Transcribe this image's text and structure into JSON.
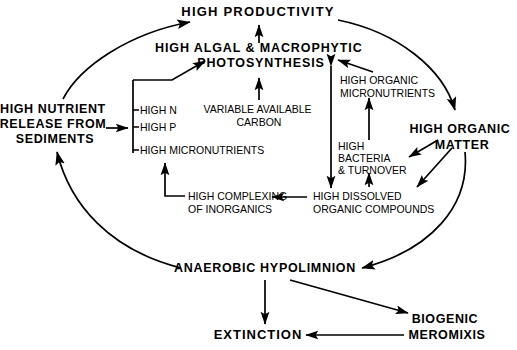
{
  "diagram": {
    "stroke_color": "#000000",
    "background_color": "#ffffff",
    "nodes": [
      {
        "id": "high-productivity",
        "label": "HIGH PRODUCTIVITY",
        "lines": [
          "HIGH PRODUCTIVITY"
        ],
        "weight": "bold",
        "size": 13,
        "x": 258,
        "y": 16,
        "anchor": "middle"
      },
      {
        "id": "high-algal-photosynthesis",
        "label": "HIGH ALGAL & MACROPHYTIC PHOTOSYNTHESIS",
        "lines": [
          "HIGH ALGAL & MACROPHYTIC",
          "PHOTOSYNTHESIS"
        ],
        "weight": "bold",
        "size": 12.5,
        "x": 261,
        "y": 52,
        "anchor": "middle"
      },
      {
        "id": "high-nutrient-release",
        "label": "HIGH NUTRIENT RELEASE FROM SEDIMENTS",
        "lines": [
          "HIGH NUTRIENT",
          "RELEASE FROM",
          "SEDIMENTS"
        ],
        "weight": "bold",
        "size": 12.5,
        "x": 55,
        "y": 113,
        "anchor": "middle"
      },
      {
        "id": "high-n",
        "label": "HIGH N",
        "lines": [
          "HIGH N"
        ],
        "weight": "normal",
        "size": 10.5,
        "x": 139,
        "y": 113,
        "anchor": "start"
      },
      {
        "id": "high-p",
        "label": "HIGH P",
        "lines": [
          "HIGH P"
        ],
        "weight": "normal",
        "size": 10.5,
        "x": 139,
        "y": 130,
        "anchor": "start"
      },
      {
        "id": "high-micronutrients",
        "label": "HIGH MICRONUTRIENTS",
        "lines": [
          "HIGH MICRONUTRIENTS"
        ],
        "weight": "normal",
        "size": 10.5,
        "x": 139,
        "y": 150,
        "anchor": "start"
      },
      {
        "id": "variable-available-carbon",
        "label": "VARIABLE AVAILABLE CARBON",
        "lines": [
          "VARIABLE AVAILABLE",
          "CARBON"
        ],
        "weight": "normal",
        "size": 10.5,
        "x": 259,
        "y": 113,
        "anchor": "middle"
      },
      {
        "id": "high-organic-micronutrients",
        "label": "HIGH ORGANIC MICRONUTRIENTS",
        "lines": [
          "HIGH ORGANIC",
          "MICRONUTRIENTS"
        ],
        "weight": "normal",
        "size": 10.5,
        "x": 340,
        "y": 84,
        "anchor": "start"
      },
      {
        "id": "high-organic-matter",
        "label": "HIGH ORGANIC MATTER",
        "lines": [
          "HIGH ORGANIC",
          "MATTER"
        ],
        "weight": "bold",
        "size": 12.5,
        "x": 462,
        "y": 133,
        "anchor": "middle"
      },
      {
        "id": "high-bacteria-turnover",
        "label": "HIGH BACTERIA & TURNOVER",
        "lines": [
          "HIGH",
          "BACTERIA",
          "& TURNOVER"
        ],
        "weight": "normal",
        "size": 10.5,
        "x": 338,
        "y": 150,
        "anchor": "start"
      },
      {
        "id": "high-complexing-inorganics",
        "label": "HIGH COMPLEXING OF INORGANICS",
        "lines": [
          "HIGH COMPLEXING",
          "OF INORGANICS"
        ],
        "weight": "normal",
        "size": 10.5,
        "x": 188,
        "y": 200,
        "anchor": "start"
      },
      {
        "id": "high-dissolved-organic",
        "label": "HIGH DISSOLVED ORGANIC COMPOUNDS",
        "lines": [
          "HIGH DISSOLVED",
          "ORGANIC COMPOUNDS"
        ],
        "weight": "normal",
        "size": 10.5,
        "x": 313,
        "y": 200,
        "anchor": "start"
      },
      {
        "id": "anaerobic-hypolimnion",
        "label": "ANAEROBIC HYPOLIMNION",
        "lines": [
          "ANAEROBIC HYPOLIMNION"
        ],
        "weight": "bold",
        "size": 12.5,
        "x": 265,
        "y": 272,
        "anchor": "middle"
      },
      {
        "id": "biogenic-meromixis",
        "label": "BIOGENIC MEROMIXIS",
        "lines": [
          "BIOGENIC",
          "MEROMIXIS"
        ],
        "weight": "bold",
        "size": 12.5,
        "x": 447,
        "y": 323,
        "anchor": "middle"
      },
      {
        "id": "extinction",
        "label": "EXTINCTION",
        "lines": [
          "EXTINCTION"
        ],
        "weight": "bold",
        "size": 13,
        "x": 258,
        "y": 339,
        "anchor": "middle"
      }
    ],
    "edges": [
      {
        "id": "edge-sediments-to-productivity",
        "from": "high-nutrient-release",
        "to": "high-productivity",
        "style": "curved-arc"
      },
      {
        "id": "edge-productivity-to-organic-matter",
        "from": "high-productivity",
        "to": "high-organic-matter",
        "style": "curved-arc"
      },
      {
        "id": "edge-organic-matter-to-hypolimnion",
        "from": "high-organic-matter",
        "to": "anaerobic-hypolimnion",
        "style": "curved-arc"
      },
      {
        "id": "edge-hypolimnion-to-sediments",
        "from": "anaerobic-hypolimnion",
        "to": "high-nutrient-release",
        "style": "curved-arc"
      },
      {
        "id": "edge-photosynthesis-to-productivity",
        "from": "high-algal-photosynthesis",
        "to": "high-productivity",
        "style": "straight"
      },
      {
        "id": "edge-carbon-to-photosynthesis",
        "from": "variable-available-carbon",
        "to": "high-algal-photosynthesis",
        "style": "straight"
      },
      {
        "id": "edge-sediments-to-nutrient-list",
        "from": "high-nutrient-release",
        "to": "high-n",
        "style": "straight"
      },
      {
        "id": "edge-nutrient-list-to-photosynthesis",
        "from": "high-n",
        "to": "high-algal-photosynthesis",
        "style": "elbow"
      },
      {
        "id": "edge-complexing-to-micronutrients",
        "from": "high-complexing-inorganics",
        "to": "high-micronutrients",
        "style": "elbow"
      },
      {
        "id": "edge-dissolved-to-complexing",
        "from": "high-dissolved-organic",
        "to": "high-complexing-inorganics",
        "style": "straight"
      },
      {
        "id": "edge-organic-micronutrients-to-photo",
        "from": "high-organic-micronutrients",
        "to": "high-algal-photosynthesis",
        "style": "straight"
      },
      {
        "id": "edge-bacteria-to-organic-micronutrients",
        "from": "high-bacteria-turnover",
        "to": "high-organic-micronutrients",
        "style": "straight"
      },
      {
        "id": "edge-dissolved-to-bacteria",
        "from": "high-dissolved-organic",
        "to": "high-bacteria-turnover",
        "style": "straight"
      },
      {
        "id": "edge-photosynthesis-dissolved-double",
        "from": "high-algal-photosynthesis",
        "to": "high-dissolved-organic",
        "style": "double-arrow"
      },
      {
        "id": "edge-organic-matter-to-bacteria",
        "from": "high-organic-matter",
        "to": "high-bacteria-turnover",
        "style": "straight"
      },
      {
        "id": "edge-organic-matter-to-dissolved",
        "from": "high-organic-matter",
        "to": "high-dissolved-organic",
        "style": "straight"
      },
      {
        "id": "edge-hypolimnion-to-extinction",
        "from": "anaerobic-hypolimnion",
        "to": "extinction",
        "style": "straight"
      },
      {
        "id": "edge-hypolimnion-to-meromixis",
        "from": "anaerobic-hypolimnion",
        "to": "biogenic-meromixis",
        "style": "straight"
      },
      {
        "id": "edge-meromixis-to-extinction",
        "from": "biogenic-meromixis",
        "to": "extinction",
        "style": "straight"
      }
    ]
  }
}
